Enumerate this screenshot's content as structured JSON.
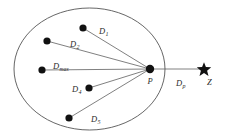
{
  "figure": {
    "background_color": "#ffffff",
    "stroke_color": "#555555",
    "dot_color": "#111111",
    "text_color": "#2b2b2b",
    "width": 226,
    "height": 138
  },
  "boundary": {
    "shape": "ellipse",
    "center_x": 89.5,
    "center_y": 69,
    "radius_x": 75.5,
    "radius_y": 61,
    "stroke_width": 0.9
  },
  "nodes": [
    {
      "id": "p",
      "name": "P",
      "label": "P",
      "label_sub": "",
      "marker": "dot",
      "x": 150,
      "y": 69,
      "radius": 4.2,
      "label_x": 147.5,
      "label_y": 77
    },
    {
      "id": "z",
      "name": "Z",
      "label": "Z",
      "label_sub": "",
      "marker": "star",
      "x": 204,
      "y": 69,
      "radius": 6.5,
      "label_x": 207,
      "label_y": 78
    }
  ],
  "interior_points": [
    {
      "id": "d1",
      "x": 83,
      "y": 28,
      "radius": 3.6
    },
    {
      "id": "d2",
      "x": 47,
      "y": 41,
      "radius": 3.6
    },
    {
      "id": "dmax",
      "x": 42,
      "y": 70,
      "radius": 3.6
    },
    {
      "id": "d4",
      "x": 89,
      "y": 88,
      "radius": 3.6
    },
    {
      "id": "d5",
      "x": 69,
      "y": 118,
      "radius": 3.6
    }
  ],
  "distance_lines": [
    {
      "id": "line-d1",
      "from_x": 83,
      "from_y": 28,
      "to_x": 150,
      "to_y": 69
    },
    {
      "id": "line-d2",
      "from_x": 47,
      "from_y": 41,
      "to_x": 150,
      "to_y": 69
    },
    {
      "id": "line-dmax",
      "from_x": 42,
      "from_y": 70,
      "to_x": 150,
      "to_y": 69
    },
    {
      "id": "line-d4",
      "from_x": 89,
      "from_y": 88,
      "to_x": 150,
      "to_y": 69
    },
    {
      "id": "line-d5",
      "from_x": 69,
      "from_y": 118,
      "to_x": 150,
      "to_y": 69
    },
    {
      "id": "line-dp",
      "from_x": 150,
      "from_y": 69,
      "to_x": 200,
      "to_y": 69
    }
  ],
  "labels": {
    "d1": {
      "base": "D",
      "sub": "1",
      "x": 99,
      "y": 27
    },
    "d2": {
      "base": "D",
      "sub": "2",
      "x": 70,
      "y": 40
    },
    "dmax": {
      "base": "D",
      "sub": "max",
      "x": 53,
      "y": 62
    },
    "d4": {
      "base": "D",
      "sub": "4",
      "x": 72,
      "y": 85
    },
    "d5": {
      "base": "D",
      "sub": "5",
      "x": 91,
      "y": 115
    },
    "dp": {
      "base": "D",
      "sub": "p",
      "x": 176,
      "y": 79
    }
  }
}
